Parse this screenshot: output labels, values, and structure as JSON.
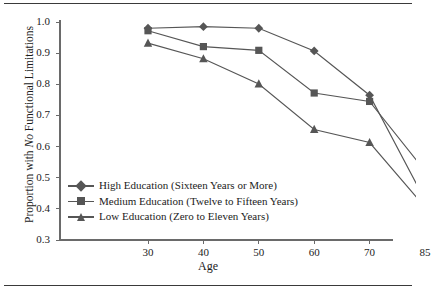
{
  "chart_data": {
    "type": "line",
    "title": "",
    "xlabel": "Age",
    "ylabel": "Proportion with No Functional Limitations",
    "ylabel_italic_word": "No",
    "categories": [
      "30",
      "40",
      "50",
      "60",
      "70",
      "85"
    ],
    "ylim": [
      0.3,
      1.0
    ],
    "yticks": [
      "1.0",
      "0.9",
      "0.8",
      "0.7",
      "0.6",
      "0.5",
      "0.4",
      "0.3"
    ],
    "ytick_values": [
      1.0,
      0.9,
      0.8,
      0.7,
      0.6,
      0.5,
      0.4,
      0.3
    ],
    "grid": false,
    "legend_position": "lower-left-inside",
    "series": [
      {
        "name": "High Education (Sixteen Years or More)",
        "marker": "diamond",
        "color": "#565656",
        "values": [
          0.98,
          0.985,
          0.98,
          0.907,
          0.765,
          0.428
        ]
      },
      {
        "name": "Medium Education (Twelve to Fifteen Years)",
        "marker": "square",
        "color": "#565656",
        "values": [
          0.972,
          0.921,
          0.909,
          0.772,
          0.745,
          0.522
        ]
      },
      {
        "name": "Low Education (Zero to Eleven Years)",
        "marker": "triangle",
        "color": "#565656",
        "values": [
          0.932,
          0.882,
          0.801,
          0.655,
          0.613,
          0.406
        ]
      }
    ]
  },
  "axes": {
    "x_axis_title": "Age",
    "y_axis_title_prefix": "Proportion with ",
    "y_axis_title_italic": "No",
    "y_axis_title_suffix": " Functional Limitations"
  },
  "legend": {
    "items": [
      {
        "label": "High Education (Sixteen Years or More)",
        "marker": "diamond-marker-icon"
      },
      {
        "label": "Medium Education (Twelve to Fifteen Years)",
        "marker": "square-marker-icon"
      },
      {
        "label": "Low Education (Zero to Eleven Years)",
        "marker": "triangle-marker-icon"
      }
    ]
  },
  "style": {
    "line_color": "#565656",
    "axis_color": "#6a6a6a",
    "rule_color": "#3a3a3a",
    "text_color": "#1c1c1c",
    "background": "#ffffff"
  }
}
